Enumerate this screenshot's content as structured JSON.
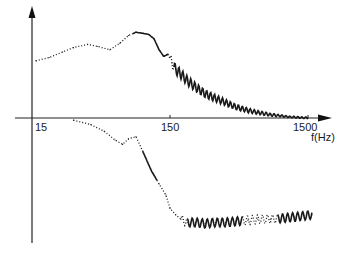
{
  "chart_data": {
    "type": "line",
    "title": "",
    "xlabel": "f(Hz)",
    "ylabel": "",
    "x_scale": "log",
    "xlim": [
      15,
      2200
    ],
    "x_ticks": [
      15,
      150,
      1500
    ],
    "x_tick_labels": [
      "15",
      "150",
      "1500"
    ],
    "grid": false,
    "legend": "none",
    "y_units": "relative (unlabeled)",
    "ylim": [
      -1.0,
      1.0
    ],
    "series": [
      {
        "name": "upper-curve",
        "color": "#1a1a1a",
        "style": "dotted-then-solid-oscillating",
        "x": [
          16,
          20,
          25,
          30,
          38,
          45,
          55,
          65,
          75,
          85,
          95,
          105,
          115,
          125,
          135,
          145,
          155,
          165,
          180,
          200,
          230,
          270,
          320,
          380,
          450,
          550,
          650,
          800,
          950,
          1100,
          1300,
          1500
        ],
        "y": [
          0.52,
          0.55,
          0.6,
          0.64,
          0.67,
          0.65,
          0.62,
          0.68,
          0.75,
          0.78,
          0.77,
          0.76,
          0.72,
          0.62,
          0.56,
          0.58,
          0.5,
          0.44,
          0.4,
          0.34,
          0.28,
          0.22,
          0.18,
          0.14,
          0.1,
          0.07,
          0.05,
          0.03,
          0.02,
          0.01,
          0.005,
          0.0
        ]
      },
      {
        "name": "lower-curve",
        "color": "#1a1a1a",
        "style": "dotted-then-solid-oscillating",
        "x": [
          30,
          40,
          50,
          60,
          68,
          75,
          85,
          95,
          110,
          125,
          140,
          150,
          165,
          180,
          200,
          230,
          270,
          320,
          380,
          450,
          550,
          650,
          800,
          1000,
          1200,
          1400,
          1600
        ],
        "y": [
          -0.02,
          -0.06,
          -0.12,
          -0.2,
          -0.24,
          -0.19,
          -0.17,
          -0.3,
          -0.48,
          -0.6,
          -0.7,
          -0.82,
          -0.88,
          -0.92,
          -0.95,
          -0.95,
          -0.96,
          -0.95,
          -0.95,
          -0.94,
          -0.93,
          -0.92,
          -0.92,
          -0.91,
          -0.9,
          -0.89,
          -0.88
        ]
      }
    ]
  }
}
